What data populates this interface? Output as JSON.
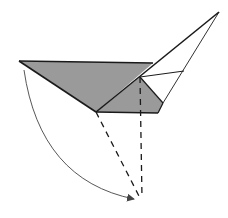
{
  "diagram": {
    "type": "origami-fold-step",
    "colors": {
      "fill": "#9a9a9a",
      "stroke": "#1a1a1a",
      "arrow": "#444444",
      "background": "#ffffff"
    },
    "shapes": {
      "left_flap": "19,61 153,63 96,112",
      "lower_flap": "96,112 140,77 163,103 158,113",
      "upper_white": "153,63 219,12 163,103 140,77"
    },
    "lines": {
      "top_edge": [
        19,
        61,
        153,
        63
      ],
      "left_edge": [
        19,
        61,
        96,
        112
      ],
      "main_diagonal": [
        96,
        112,
        219,
        12
      ],
      "right_edge": [
        219,
        12,
        163,
        103
      ],
      "inner_crease": [
        140,
        77,
        184,
        71
      ],
      "inner_diag": [
        140,
        77,
        163,
        103
      ],
      "bottom_edge": [
        96,
        112,
        158,
        113
      ],
      "bottom_right": [
        158,
        113,
        163,
        103
      ]
    },
    "dashed_lines": [
      [
        96,
        112,
        140,
        198
      ],
      [
        140,
        77,
        142,
        198
      ]
    ],
    "arrow": {
      "path": "M 24 70 Q 40 180 134 199",
      "head_at": [
        134,
        199
      ]
    }
  }
}
